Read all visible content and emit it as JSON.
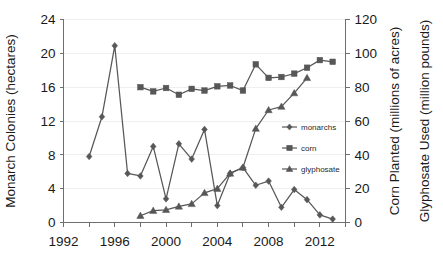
{
  "chart_data": {
    "type": "line",
    "title": "",
    "xlabel": "",
    "ylabel": "Monarch Colonies (hectares)",
    "y2label_1": "Corn Planted (millions of acres)",
    "y2label_2": "Glyphosate Used (million pounds)",
    "xlim": [
      1992,
      2014
    ],
    "ylim": [
      0,
      24
    ],
    "y2lim": [
      0,
      120
    ],
    "grid": true,
    "legend_position": "center-right",
    "x_ticks": [
      1992,
      1996,
      2000,
      2004,
      2008,
      2012
    ],
    "x_minor_ticks": [
      1994,
      1998,
      2002,
      2006,
      2010,
      2014
    ],
    "y_ticks": [
      0,
      4,
      8,
      12,
      16,
      20,
      24
    ],
    "y2_ticks": [
      0,
      20,
      40,
      60,
      80,
      100,
      120
    ],
    "x_tick_labels": [
      "1992",
      "1996",
      "2000",
      "2004",
      "2008",
      "2012"
    ],
    "y_tick_labels": [
      "0",
      "4",
      "8",
      "12",
      "16",
      "20",
      "24"
    ],
    "y2_tick_labels": [
      "0",
      "20",
      "40",
      "60",
      "80",
      "100",
      "120"
    ],
    "series": [
      {
        "name": "monarchs",
        "marker": "diamond",
        "axis": "left",
        "units": "hectares",
        "color": "#575757",
        "x": [
          1994,
          1995,
          1996,
          1997,
          1998,
          1999,
          2000,
          2001,
          2002,
          2003,
          2004,
          2005,
          2006,
          2007,
          2008,
          2009,
          2010,
          2011,
          2012,
          2013
        ],
        "values": [
          7.8,
          12.5,
          20.9,
          5.8,
          5.5,
          9.0,
          2.8,
          9.3,
          7.5,
          11.0,
          2.0,
          5.8,
          6.5,
          4.4,
          4.9,
          1.8,
          3.9,
          2.7,
          0.9,
          0.4
        ]
      },
      {
        "name": "corn",
        "marker": "square",
        "axis": "right",
        "units": "millions of acres",
        "color": "#686868",
        "x": [
          1998,
          1999,
          2000,
          2001,
          2002,
          2003,
          2004,
          2005,
          2006,
          2007,
          2008,
          2009,
          2010,
          2011,
          2012,
          2013
        ],
        "values": [
          80,
          77.5,
          79.5,
          75.5,
          79,
          78,
          80.5,
          81,
          78,
          93.5,
          85.5,
          86,
          88,
          91.5,
          96,
          95
        ]
      },
      {
        "name": "glyphosate",
        "marker": "triangle",
        "axis": "right",
        "units": "million pounds",
        "color": "#575757",
        "x": [
          1998,
          1999,
          2000,
          2001,
          2002,
          2003,
          2004,
          2005,
          2006,
          2007,
          2008,
          2009,
          2010,
          2011
        ],
        "values": [
          4,
          7,
          7.5,
          9.5,
          11,
          17.5,
          20,
          29,
          32.5,
          55.5,
          66.5,
          68.5,
          76.5,
          85.5
        ]
      }
    ]
  },
  "legend": {
    "items": [
      {
        "label": "monarchs",
        "marker": "diamond"
      },
      {
        "label": "corn",
        "marker": "square"
      },
      {
        "label": "glyphosate",
        "marker": "triangle"
      }
    ]
  }
}
